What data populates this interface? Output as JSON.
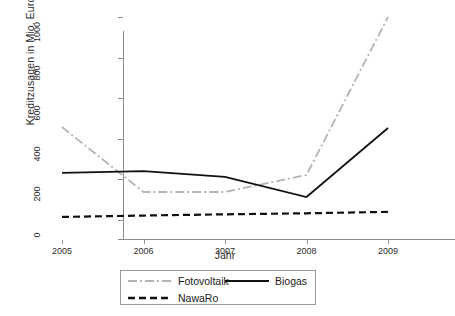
{
  "chart_data": {
    "type": "line",
    "title": "",
    "xlabel": "Jahr",
    "ylabel": "Kreditzusagen in Mio. Euro",
    "x": [
      2005,
      2006,
      2007,
      2008,
      2009
    ],
    "xticklabels": [
      "2005",
      "2006",
      "2007",
      "2008",
      "2009"
    ],
    "yticklabels": [
      "0",
      "200",
      "400",
      "600",
      "800",
      "1000"
    ],
    "yticks": [
      0,
      200,
      400,
      600,
      800,
      1000
    ],
    "xlim": [
      2005,
      2009
    ],
    "ylim": [
      0,
      1000
    ],
    "grid": false,
    "legend_position": "bottom-center",
    "series": [
      {
        "name": "Fotovoltaik",
        "values": [
          458,
          138,
          138,
          222,
          1000
        ],
        "color": "#b4b4b4",
        "linestyle": "dashdot"
      },
      {
        "name": "Biogas",
        "values": [
          232,
          241,
          212,
          113,
          453
        ],
        "color": "#111111",
        "linestyle": "solid"
      },
      {
        "name": "NawaRo",
        "values": [
          15,
          22,
          28,
          33,
          40
        ],
        "color": "#111111",
        "linestyle": "dashed"
      }
    ]
  },
  "axes": {
    "y_title": "Kreditzusagen in Mio. Euro",
    "x_title": "Jahr",
    "y_ticks": [
      {
        "label": "0",
        "value": 0
      },
      {
        "label": "200",
        "value": 200
      },
      {
        "label": "400",
        "value": 400
      },
      {
        "label": "600",
        "value": 600
      },
      {
        "label": "800",
        "value": 800
      },
      {
        "label": "1000",
        "value": 1000
      }
    ],
    "x_ticks": [
      {
        "label": "2005",
        "value": 2005
      },
      {
        "label": "2006",
        "value": 2006
      },
      {
        "label": "2007",
        "value": 2007
      },
      {
        "label": "2008",
        "value": 2008
      },
      {
        "label": "2009",
        "value": 2009
      }
    ]
  },
  "legend": {
    "entries": [
      {
        "label": "Fotovoltaik",
        "color": "#b4b4b4",
        "linestyle": "dashdot"
      },
      {
        "label": "NawaRo",
        "color": "#111111",
        "linestyle": "dashed"
      },
      {
        "label": "Biogas",
        "color": "#111111",
        "linestyle": "solid"
      }
    ]
  }
}
